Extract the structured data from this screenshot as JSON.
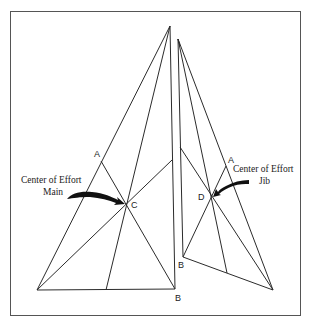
{
  "figure": {
    "frame": {
      "x": 10,
      "y": 11,
      "w": 291,
      "h": 305
    },
    "colors": {
      "line": "#2b2b2b",
      "frame": "#555555",
      "arrow": "#111111"
    },
    "mainsail": {
      "head": [
        170,
        26
      ],
      "tack": [
        37,
        290
      ],
      "clew": [
        175,
        289
      ],
      "luff_mid": [
        101,
        161
      ],
      "leech_mid": [
        172,
        160
      ],
      "foot_mid": [
        106,
        290
      ],
      "center": [
        126,
        204
      ],
      "label_A": {
        "text": "A",
        "x": 94,
        "y": 157
      },
      "label_C": {
        "text": "C",
        "x": 131,
        "y": 208
      },
      "label_B": {
        "text": "B",
        "x": 175,
        "y": 301
      }
    },
    "jib": {
      "head": [
        178,
        39
      ],
      "tack": [
        183,
        257
      ],
      "clew": [
        273,
        290
      ],
      "luff_mid": [
        180,
        147
      ],
      "leech_mid": [
        226,
        166
      ],
      "foot_mid": [
        227,
        273
      ],
      "center": [
        212,
        197
      ],
      "label_A": {
        "text": "A",
        "x": 228,
        "y": 163
      },
      "label_D": {
        "text": "D",
        "x": 198,
        "y": 199
      },
      "label_B": {
        "text": "B",
        "x": 178,
        "y": 268
      }
    },
    "callouts": {
      "main": {
        "line1": "Center of Effort",
        "line2": "Main"
      },
      "jib": {
        "line1": "Center of Effort",
        "line2": "Jib"
      }
    }
  }
}
